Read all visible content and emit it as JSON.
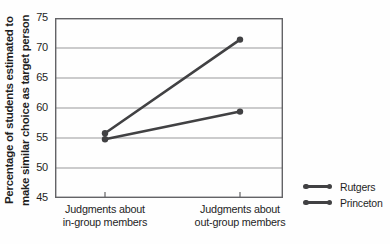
{
  "chart_data": {
    "type": "line",
    "title": "",
    "ylabel_lines": [
      "Percentage of students estimated to",
      "make similar choice as target person"
    ],
    "categories": [
      [
        "Judgments about",
        "in-group members"
      ],
      [
        "Judgments about",
        "out-group members"
      ]
    ],
    "series": [
      {
        "name": "Rutgers",
        "values": [
          55.8,
          71.4
        ]
      },
      {
        "name": "Princeton",
        "values": [
          54.8,
          59.4
        ]
      }
    ],
    "ylim": [
      45,
      75
    ],
    "yticks": [
      45,
      50,
      55,
      60,
      65,
      70,
      75
    ],
    "grid": true,
    "legend_position": "bottom-right",
    "colors": {
      "line": "#414143",
      "grid": "#98989a",
      "axis": "#636366",
      "text": "#1f1f1f"
    }
  },
  "legend": {
    "items": [
      "Rutgers",
      "Princeton"
    ]
  }
}
